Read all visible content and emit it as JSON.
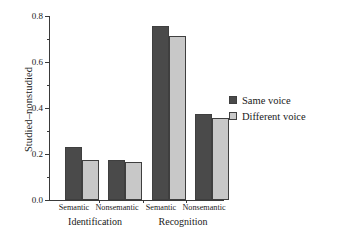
{
  "chart_data": {
    "type": "bar",
    "title": "",
    "xlabel": "",
    "ylabel": "Studied–nonstudied",
    "ylim": [
      0.0,
      0.8
    ],
    "ytick_labels": [
      "0.0",
      "0.2",
      "0.4",
      "0.6",
      "0.8"
    ],
    "ytick_values": [
      0.0,
      0.2,
      0.4,
      0.6,
      0.8
    ],
    "yminor_values": [
      0.1,
      0.3,
      0.5,
      0.7
    ],
    "grid": false,
    "legend_position": "right",
    "categories": [
      "Semantic",
      "Nonsemantic",
      "Semantic",
      "Nonsemantic"
    ],
    "groups": [
      {
        "label": "Identification",
        "categories": [
          "Semantic",
          "Nonsemantic"
        ]
      },
      {
        "label": "Recognition",
        "categories": [
          "Semantic",
          "Nonsemantic"
        ]
      }
    ],
    "series": [
      {
        "name": "Same voice",
        "color": "#4a4a4a",
        "values": [
          0.23,
          0.175,
          0.755,
          0.375
        ]
      },
      {
        "name": "Different voice",
        "color": "#c8c8c8",
        "values": [
          0.175,
          0.165,
          0.715,
          0.355
        ]
      }
    ]
  },
  "axis": {
    "y_title": "Studied–nonstudied",
    "ticks": [
      {
        "label": "0.8",
        "value": 0.8
      },
      {
        "label": "0.6",
        "value": 0.6
      },
      {
        "label": "0.4",
        "value": 0.4
      },
      {
        "label": "0.2",
        "value": 0.2
      },
      {
        "label": "0.0",
        "value": 0.0
      }
    ]
  },
  "x_labels": {
    "cat_0": "Semantic",
    "cat_1": "Nonsemantic",
    "cat_2": "Semantic",
    "cat_3": "Nonsemantic",
    "group_0": "Identification",
    "group_1": "Recognition"
  },
  "legend": {
    "items": [
      {
        "label": "Same voice",
        "color": "#4a4a4a"
      },
      {
        "label": "Different voice",
        "color": "#c8c8c8"
      }
    ]
  }
}
